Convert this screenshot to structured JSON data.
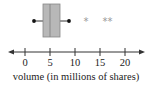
{
  "chart_data": {
    "type": "boxplot",
    "title": "",
    "xlabel": "volume (in millions of shares)",
    "ylabel": "",
    "xlim": [
      -2,
      23
    ],
    "ticks": [
      0,
      5,
      10,
      15,
      20
    ],
    "tick_labels": [
      "0",
      "5",
      "10",
      "15",
      "20"
    ],
    "grid": false,
    "legend": null,
    "box": {
      "min_whisker": 1.8,
      "q1": 3.6,
      "median": 5,
      "q3": 7,
      "max_whisker": 8.8
    },
    "outliers": [
      12.2,
      16,
      17
    ],
    "colors": {
      "box_fill": "#b8b8b8",
      "box_stroke": "#888888",
      "whisker": "#555555",
      "dot": "#111111",
      "outlier": "#999999",
      "axis": "#333333"
    }
  }
}
